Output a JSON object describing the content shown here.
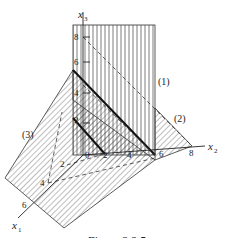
{
  "figure": {
    "caption": "Figure 2.2.5",
    "axes": {
      "x1": {
        "label": "x",
        "sub": "1",
        "ticks": [
          "2",
          "4",
          "6"
        ]
      },
      "x2": {
        "label": "x",
        "sub": "2",
        "ticks": [
          "2",
          "4",
          "6",
          "8"
        ]
      },
      "x3": {
        "label": "x",
        "sub": "3",
        "ticks": [
          "2",
          "4",
          "6",
          "8"
        ]
      },
      "origin": "0"
    },
    "regions": [
      {
        "id": "1",
        "label": "(1)",
        "hatch": "vertical"
      },
      {
        "id": "2",
        "label": "(2)",
        "hatch": "diagonal"
      },
      {
        "id": "3",
        "label": "(3)",
        "hatch": "diagonal"
      }
    ],
    "colors": {
      "ink": "#222222",
      "background": "#ffffff"
    }
  }
}
